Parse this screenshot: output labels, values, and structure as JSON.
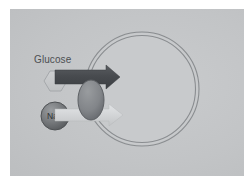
{
  "figure": {
    "title_alt": "Sodium-glucose cotransport across cell membrane",
    "background_color": "#c2c4c6",
    "frame_color": "#cdcfd1",
    "page_color": "#ffffff"
  },
  "labels": {
    "glucose": "Glucose",
    "sodium_symbol": "Na",
    "sodium_charge": "+"
  },
  "shapes": {
    "glucose_molecule": {
      "name": "hexagon",
      "fill": "#c6c8ca",
      "stroke": "#9fa2a5"
    },
    "sodium_ion": {
      "name": "sphere",
      "fill": "#76797c",
      "stroke": "#4d5053"
    },
    "transport_protein": {
      "name": "oval",
      "fill": "#83868a",
      "stroke": "#5d6064"
    },
    "cell_membrane": {
      "name": "bilayer-circle",
      "stroke": "#8c8f92",
      "interior_fill": "#c7c9cb"
    }
  },
  "arrows": {
    "glucose_arrow": {
      "label_alt": "glucose transport direction",
      "color": "#4a4d50",
      "direction": "right"
    },
    "sodium_arrow": {
      "label_alt": "sodium transport direction",
      "color": "#d5d7d9",
      "direction": "right"
    }
  }
}
